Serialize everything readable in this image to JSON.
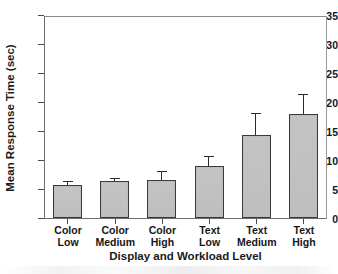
{
  "chart_data": {
    "type": "bar",
    "title": "",
    "subtitle": "",
    "xlabel": "Display and Workload Level",
    "ylabel": "Mean Response Time (sec)",
    "categories": [
      "Color Low",
      "Color Medium",
      "Color High",
      "Text Low",
      "Text Medium",
      "Text High"
    ],
    "category_lines": [
      {
        "line1": "Color",
        "line2": "Low"
      },
      {
        "line1": "Color",
        "line2": "Medium"
      },
      {
        "line1": "Color",
        "line2": "High"
      },
      {
        "line1": "Text",
        "line2": "Low"
      },
      {
        "line1": "Text",
        "line2": "Medium"
      },
      {
        "line1": "Text",
        "line2": "High"
      }
    ],
    "values": [
      5.7,
      6.4,
      6.6,
      9.0,
      14.4,
      18.0
    ],
    "error_upper": [
      6.4,
      6.9,
      8.1,
      10.6,
      18.0,
      21.3
    ],
    "error_bars": "upper only (SE)",
    "ylim": [
      0,
      35
    ],
    "yticks": [
      0,
      5,
      10,
      15,
      20,
      25,
      30,
      35
    ],
    "ytick_labels": [
      "0",
      "5",
      "10",
      "15",
      "20",
      "25",
      "30",
      "35"
    ],
    "grid": false,
    "legend": "none",
    "bar_fill_color": "#bdbdbd",
    "bar_edge_color": "#3a3a3a",
    "axis_color": "#4a4a4a"
  }
}
